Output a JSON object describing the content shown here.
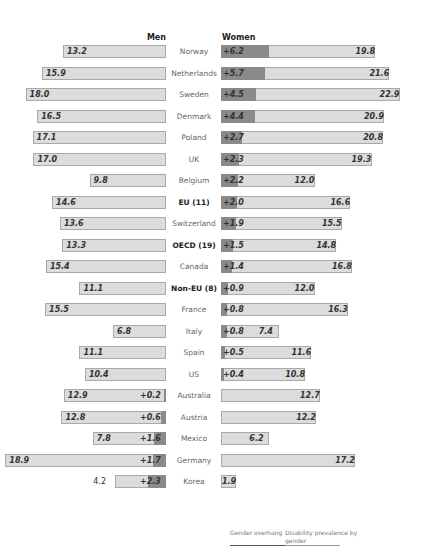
{
  "headers": {
    "men": "Men",
    "women": "Women"
  },
  "legend": {
    "overhang": "Gender overhang",
    "prevalence": "Disability prevalence by gender"
  },
  "colors": {
    "bar": "#dcdcdc",
    "overhang": "#8a8a8a",
    "border": "#a9a9a9"
  },
  "chart_data": {
    "type": "bar",
    "orientation": "horizontal-butterfly",
    "title": "",
    "xlabel": "",
    "ylabel": "",
    "legend": [
      "Gender overhang",
      "Disability prevalence by gender"
    ],
    "legend_position": "bottom-right",
    "grid": false,
    "categories": [
      "Norway",
      "Netherlands",
      "Sweden",
      "Denmark",
      "Poland",
      "UK",
      "Belgium",
      "EU (11)",
      "Switzerland",
      "OECD (19)",
      "Canada",
      "Non-EU (8)",
      "France",
      "Italy",
      "Spain",
      "US",
      "Australia",
      "Austria",
      "Mexico",
      "Germany",
      "Korea"
    ],
    "bold_categories": [
      "EU (11)",
      "OECD (19)",
      "Non-EU (8)"
    ],
    "series": [
      {
        "name": "Men",
        "values": [
          13.2,
          15.9,
          18.0,
          16.5,
          17.1,
          17.0,
          9.8,
          14.6,
          13.6,
          13.3,
          15.4,
          11.1,
          15.5,
          6.8,
          11.1,
          10.4,
          12.9,
          12.8,
          7.8,
          18.9,
          4.2
        ]
      },
      {
        "name": "Women",
        "values": [
          19.8,
          21.6,
          22.9,
          20.9,
          20.8,
          19.3,
          12.0,
          16.6,
          15.5,
          14.8,
          16.8,
          12.0,
          16.3,
          7.4,
          11.6,
          10.8,
          12.7,
          12.2,
          6.2,
          17.2,
          1.9
        ]
      },
      {
        "name": "Gender overhang",
        "values": [
          "+6.2",
          "+5.7",
          "+4.5",
          "+4.4",
          "+2.7",
          "+2.3",
          "+2.2",
          "+2.0",
          "+1.9",
          "+1.5",
          "+1.4",
          "+0.9",
          "+0.8",
          "+0.8",
          "+0.5",
          "+0.4",
          "+0.2",
          "+0.6",
          "+1.6",
          "+1.7",
          "+2.3"
        ],
        "side": [
          "W",
          "W",
          "W",
          "W",
          "W",
          "W",
          "W",
          "W",
          "W",
          "W",
          "W",
          "W",
          "W",
          "W",
          "W",
          "W",
          "M",
          "M",
          "M",
          "M",
          "M"
        ]
      }
    ]
  }
}
